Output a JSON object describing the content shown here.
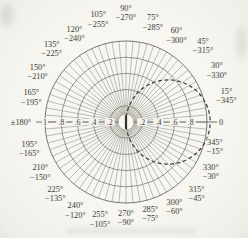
{
  "chart_data": {
    "type": "polar",
    "title": "",
    "description_visible_text_only": true,
    "rings": [
      0.2,
      0.4,
      0.6,
      0.8,
      1.0
    ],
    "spoke_step_deg": 5,
    "radial_axis": {
      "left_end_label": "±180°",
      "right_end_label": "0",
      "left_ticks": [
        {
          "label": "1",
          "value": 1.0
        },
        {
          "label": ".8",
          "value": 0.8
        },
        {
          "label": ".6",
          "value": 0.6
        },
        {
          "label": ".4",
          "value": 0.4
        },
        {
          "label": ".2",
          "value": 0.2
        }
      ],
      "right_ticks": [
        {
          "label": ".2",
          "value": 0.2
        },
        {
          "label": ".4",
          "value": 0.4
        },
        {
          "label": ".6",
          "value": 0.6
        },
        {
          "label": ".8",
          "value": 0.8
        }
      ]
    },
    "angle_labels": [
      {
        "deg": 15,
        "primary": "15°",
        "secondary": "−345°",
        "r": 104
      },
      {
        "deg": 30,
        "primary": "30°",
        "secondary": "−330°",
        "r": 105
      },
      {
        "deg": 45,
        "primary": "45°",
        "secondary": "−315°",
        "r": 109
      },
      {
        "deg": 60,
        "primary": "60°",
        "secondary": "−300°",
        "r": 101
      },
      {
        "deg": 75,
        "primary": "75°",
        "secondary": "−285°",
        "r": 104
      },
      {
        "deg": 90,
        "primary": "90°",
        "secondary": "−270°",
        "r": 110
      },
      {
        "deg": 105,
        "primary": "105°",
        "secondary": "−255°",
        "r": 107
      },
      {
        "deg": 120,
        "primary": "120°",
        "secondary": "−240°",
        "r": 103
      },
      {
        "deg": 135,
        "primary": "135°",
        "secondary": "−225°",
        "r": 105
      },
      {
        "deg": 150,
        "primary": "150°",
        "secondary": "−210°",
        "r": 102
      },
      {
        "deg": 165,
        "primary": "165°",
        "secondary": "−195°",
        "r": 98
      },
      {
        "deg": 195,
        "primary": "195°",
        "secondary": "−165°",
        "r": 100
      },
      {
        "deg": 210,
        "primary": "210°",
        "secondary": "−150°",
        "r": 99
      },
      {
        "deg": 225,
        "primary": "225°",
        "secondary": "−135°",
        "r": 100
      },
      {
        "deg": 240,
        "primary": "240°",
        "secondary": "−120°",
        "r": 101
      },
      {
        "deg": 255,
        "primary": "255°",
        "secondary": "−105°",
        "r": 100
      },
      {
        "deg": 270,
        "primary": "270°",
        "secondary": "−90°",
        "r": 95
      },
      {
        "deg": 285,
        "primary": "285°",
        "secondary": "−75°",
        "r": 94
      },
      {
        "deg": 300,
        "primary": "300°",
        "secondary": "−60°",
        "r": 97
      },
      {
        "deg": 315,
        "primary": "315°",
        "secondary": "−45°",
        "r": 100
      },
      {
        "deg": 330,
        "primary": "330°",
        "secondary": "−30°",
        "r": 98
      },
      {
        "deg": 345,
        "primary": "345°",
        "secondary": "−15°",
        "r": 92
      }
    ],
    "dashed_circle": {
      "center_offset": 0.52,
      "radius": 0.52,
      "style": "dashed",
      "passes_through_origin": true
    },
    "layout": {
      "center_x": 126,
      "center_y": 122,
      "outer_radius_px": 81,
      "axis_x1": 36,
      "axis_x2": 217,
      "grid": "on",
      "legend": "none"
    },
    "colors": {
      "background": "#f4f3ee",
      "spoke": "#807e74",
      "ring": "#6c6a61",
      "axis": "#55534b",
      "text": "#403f38",
      "dashed": "#3f3e38",
      "center_disk": "#f7f6f1",
      "center_marker": "#34332e"
    }
  }
}
